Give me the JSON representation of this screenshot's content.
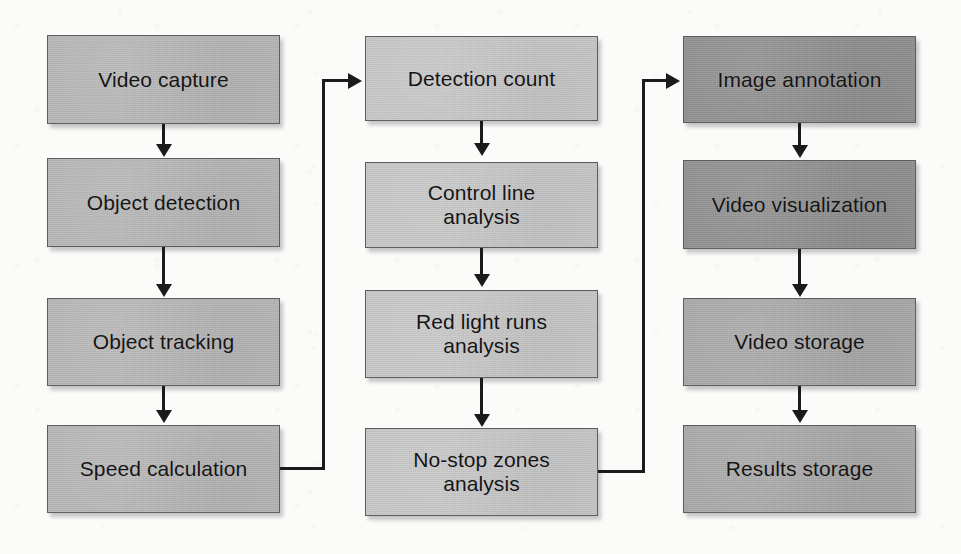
{
  "diagram": {
    "background_color": "#fbfbfa",
    "line_color": "#1b1b1b",
    "columns": [
      {
        "name": "acquisition-and-tracking",
        "fill_color": "#b6b6b6",
        "nodes": [
          {
            "id": "video-capture",
            "label": "Video capture",
            "tone": "light"
          },
          {
            "id": "object-detection",
            "label": "Object detection",
            "tone": "light"
          },
          {
            "id": "object-tracking",
            "label": "Object tracking",
            "tone": "light"
          },
          {
            "id": "speed-calculation",
            "label": "Speed calculation",
            "tone": "light"
          }
        ]
      },
      {
        "name": "traffic-analysis",
        "fill_color": "#c7c7c7",
        "nodes": [
          {
            "id": "detection-count",
            "label": "Detection count",
            "tone": "lighter"
          },
          {
            "id": "control-line-analysis",
            "label": "Control line\nanalysis",
            "tone": "lighter"
          },
          {
            "id": "red-light-runs-analysis",
            "label": "Red light runs\nanalysis",
            "tone": "lighter"
          },
          {
            "id": "no-stop-zones-analysis",
            "label": "No-stop zones\nanalysis",
            "tone": "lighter"
          }
        ]
      },
      {
        "name": "output-and-storage",
        "fill_color": "#8f8f8f",
        "nodes": [
          {
            "id": "image-annotation",
            "label": "Image annotation",
            "tone": "dark"
          },
          {
            "id": "video-visualization",
            "label": "Video visualization",
            "tone": "dark"
          },
          {
            "id": "video-storage",
            "label": "Video storage",
            "tone": "mid"
          },
          {
            "id": "results-storage",
            "label": "Results storage",
            "tone": "mid"
          }
        ]
      }
    ],
    "edges": [
      {
        "id": "video-capture-to-object-detection",
        "from": "video-capture",
        "to": "object-detection",
        "kind": "vertical"
      },
      {
        "id": "object-detection-to-object-tracking",
        "from": "object-detection",
        "to": "object-tracking",
        "kind": "vertical"
      },
      {
        "id": "object-tracking-to-speed-calculation",
        "from": "object-tracking",
        "to": "speed-calculation",
        "kind": "vertical"
      },
      {
        "id": "speed-calculation-to-detection-count",
        "from": "speed-calculation",
        "to": "detection-count",
        "kind": "elbow"
      },
      {
        "id": "detection-count-to-control-line-analysis",
        "from": "detection-count",
        "to": "control-line-analysis",
        "kind": "vertical"
      },
      {
        "id": "control-line-to-red-light-runs",
        "from": "control-line-analysis",
        "to": "red-light-runs-analysis",
        "kind": "vertical"
      },
      {
        "id": "red-light-runs-to-no-stop-zones",
        "from": "red-light-runs-analysis",
        "to": "no-stop-zones-analysis",
        "kind": "vertical"
      },
      {
        "id": "no-stop-zones-to-image-annotation",
        "from": "no-stop-zones-analysis",
        "to": "image-annotation",
        "kind": "elbow"
      },
      {
        "id": "image-annotation-to-video-visualization",
        "from": "image-annotation",
        "to": "video-visualization",
        "kind": "vertical"
      },
      {
        "id": "video-visualization-to-video-storage",
        "from": "video-visualization",
        "to": "video-storage",
        "kind": "vertical"
      },
      {
        "id": "video-storage-to-results-storage",
        "from": "video-storage",
        "to": "results-storage",
        "kind": "vertical"
      }
    ]
  }
}
